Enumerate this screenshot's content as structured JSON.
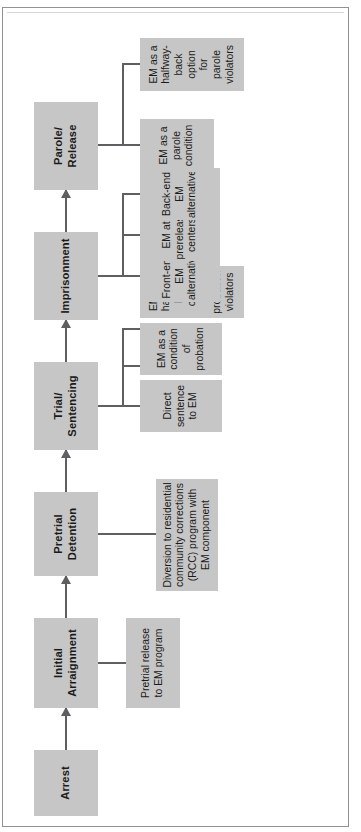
{
  "figure": {
    "type": "flowchart",
    "orientation": "rotated-90-ccw",
    "colors": {
      "node_fill": "#c6c6c6",
      "node_text": "#1b1b1b",
      "connector": "#5d5f62",
      "frame": "#8f9194",
      "page": "#ffffff"
    }
  },
  "stages": [
    {
      "id": "arrest",
      "label": "Arrest"
    },
    {
      "id": "arraignment",
      "label": "Initial\nArraignment"
    },
    {
      "id": "pretrial",
      "label": "Pretrial\nDetention"
    },
    {
      "id": "trial",
      "label": "Trial/\nSentencing"
    },
    {
      "id": "prison",
      "label": "Imprisonment"
    },
    {
      "id": "parole",
      "label": "Parole/\nRelease"
    }
  ],
  "options": {
    "arraignment": [
      {
        "id": "pretrial-release",
        "label": "Pretrial release\nto EM program"
      }
    ],
    "pretrial": [
      {
        "id": "rcc-diversion",
        "label": "Diversion to residential\ncommunity corrections\n(RCC) program with\nEM component"
      }
    ],
    "trial": [
      {
        "id": "direct-sentence",
        "label": "Direct\nsentence\nto EM"
      },
      {
        "id": "probation-condition",
        "label": "EM as a\ncondition of\nprobation"
      },
      {
        "id": "probation-halfway-back",
        "label": "EM as a\nhalfway-\nback option\nfor\nprobation\nviolators"
      }
    ],
    "prison": [
      {
        "id": "front-end-em",
        "label": "Front-end\nEM\nalternative"
      },
      {
        "id": "prerelease-em",
        "label": "EM at\nprerelease\ncenters"
      },
      {
        "id": "back-end-em",
        "label": "Back-end\nEM\nalternative"
      }
    ],
    "parole": [
      {
        "id": "parole-condition",
        "label": "EM as a\nparole\ncondition"
      },
      {
        "id": "parole-halfway-back",
        "label": "EM as a\nhalfway-\nback option\nfor\nparole\nviolators"
      }
    ]
  },
  "flow_sequence": [
    "Arrest",
    "Initial Arraignment",
    "Pretrial Detention",
    "Trial/Sentencing",
    "Imprisonment",
    "Parole/Release"
  ]
}
